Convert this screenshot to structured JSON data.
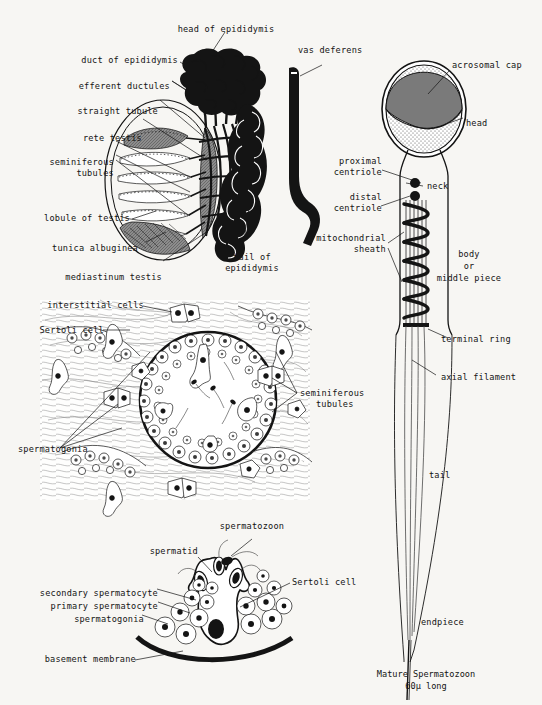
{
  "page": {
    "background": "#f7f6f3",
    "ink": "#141414"
  },
  "figures": {
    "testis": {
      "name": "Testis and epididymis longitudinal section",
      "labels": {
        "head_of_epididymis": "head of epididymis",
        "duct_of_epididymis": "duct of epididymis",
        "efferent_ductules": "efferent ductules",
        "straight_tubule": "straight tubule",
        "rete_testis": "rete testis",
        "seminiferous_tubules_l1": "seminiferous",
        "seminiferous_tubules_l2": "tubules",
        "lobule_of_testis": "lobule of testis",
        "tunica_albuginea": "tunica albuginea",
        "mediastinum_testis": "mediastinum testis",
        "vas_deferens": "vas deferens",
        "tail_of_epididymis_l1": "tail of",
        "tail_of_epididymis_l2": "epididymis"
      }
    },
    "cross_section": {
      "name": "Seminiferous tubules cross section",
      "labels": {
        "interstitial_cells": "interstitial cells",
        "sertoli_cell": "Sertoli cell",
        "spermatogonia": "spermatogonia",
        "seminiferous_tubules_l1": "seminiferous",
        "seminiferous_tubules_l2": "tubules"
      }
    },
    "epithelium": {
      "name": "Germinal epithelium spermatogenesis",
      "labels": {
        "spermatozoon": "spermatozoon",
        "spermatid": "spermatid",
        "sertoli_cell": "Sertoli cell",
        "secondary_spermatocyte": "secondary spermatocyte",
        "primary_spermatocyte": "primary spermatocyte",
        "spermatogonia": "spermatogonia",
        "basement_membrane": "basement membrane"
      }
    },
    "spermatozoon": {
      "name": "Mature spermatozoon",
      "labels": {
        "acrosomal_cap": "acrosomal cap",
        "head": "head",
        "neck": "neck",
        "proximal_centriole_l1": "proximal",
        "proximal_centriole_l2": "centriole",
        "distal_centriole_l1": "distal",
        "distal_centriole_l2": "centriole",
        "mitochondrial_sheath_l1": "mitochondrial",
        "mitochondrial_sheath_l2": "sheath",
        "body_l1": "body",
        "body_l2": "or",
        "body_l3": "middle piece",
        "terminal_ring": "terminal ring",
        "axial_filament": "axial filament",
        "tail": "tail",
        "endpiece": "endpiece"
      },
      "caption_line1": "Mature Spermatozoon",
      "caption_line2": "60µ long",
      "colors": {
        "acrosomal_cap": "#7a7a7a",
        "nucleus": "#d8d8d8",
        "outline": "#141414"
      }
    }
  }
}
